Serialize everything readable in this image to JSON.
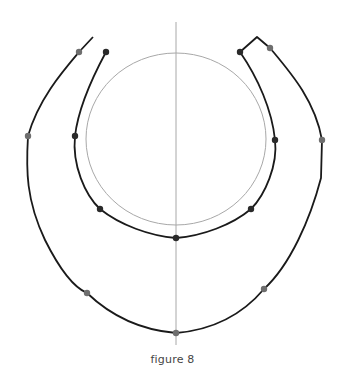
{
  "caption": "figure 8",
  "colors": {
    "curve": "#1a1a1a",
    "guide": "#a8a8a8",
    "dot_dark": "#2a2a2a",
    "dot_grey": "#6e6e6e",
    "caption": "#444444"
  },
  "guides": {
    "vertical_axis": {
      "x": 176,
      "y1": 22,
      "y2": 345
    },
    "circle": {
      "cx": 176,
      "cy": 139,
      "rx": 90,
      "ry": 86
    }
  },
  "curves": {
    "outer": "M93,37 L79,52 C62,72 38,100 28,136 C26,170 26,200 45,240 C60,270 75,288 87,293 C110,315 140,330 176,333 C212,330 242,315 264,289 C290,265 310,220 321,178 L322,140 C315,100 290,72 270,48 L257,37 L240,52",
    "inner": "M106,52 C92,78 78,110 75,136 C72,165 85,195 100,209 C120,225 150,236 176,238 C202,236 232,225 251,209 C265,195 278,165 275,140 C272,110 258,78 240,52",
    "outer_tip_left": "M93,37 L106,52",
    "outer_tip_right": "M257,37 L240,52"
  },
  "points": [
    {
      "name": "outer-top-left",
      "x": 79,
      "y": 52,
      "tone": "grey"
    },
    {
      "name": "inner-top-left",
      "x": 106,
      "y": 52,
      "tone": "dark"
    },
    {
      "name": "inner-top-right",
      "x": 240,
      "y": 52,
      "tone": "dark"
    },
    {
      "name": "outer-top-right",
      "x": 270,
      "y": 48,
      "tone": "grey"
    },
    {
      "name": "outer-mid-left",
      "x": 28,
      "y": 136,
      "tone": "grey"
    },
    {
      "name": "inner-mid-left",
      "x": 75,
      "y": 136,
      "tone": "dark"
    },
    {
      "name": "inner-mid-right",
      "x": 275,
      "y": 140,
      "tone": "dark"
    },
    {
      "name": "outer-mid-right",
      "x": 322,
      "y": 140,
      "tone": "grey"
    },
    {
      "name": "inner-lower-left",
      "x": 100,
      "y": 209,
      "tone": "dark"
    },
    {
      "name": "inner-lower-right",
      "x": 251,
      "y": 209,
      "tone": "dark"
    },
    {
      "name": "inner-bottom",
      "x": 176,
      "y": 238,
      "tone": "dark"
    },
    {
      "name": "outer-lower-left",
      "x": 87,
      "y": 293,
      "tone": "grey"
    },
    {
      "name": "outer-lower-right",
      "x": 264,
      "y": 289,
      "tone": "grey"
    },
    {
      "name": "outer-bottom",
      "x": 176,
      "y": 333,
      "tone": "grey"
    }
  ]
}
